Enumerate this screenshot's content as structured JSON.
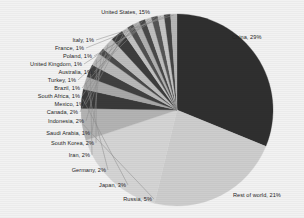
{
  "chart_data": {
    "type": "pie",
    "title": "",
    "subtitle": "",
    "xlabel": "",
    "ylabel": "",
    "legend_position": "none",
    "grid": false,
    "label_format": "{name}, {value}%",
    "categories": [
      "China",
      "Rest of world",
      "United States",
      "Russia",
      "Japan",
      "Germany",
      "Iran",
      "South Korea",
      "Saudi Arabia",
      "Indonesia",
      "Canada",
      "Mexico",
      "South Africa",
      "Brazil",
      "Turkey",
      "Australia",
      "United Kingdom",
      "Poland",
      "France",
      "Italy"
    ],
    "values": [
      29,
      21,
      15,
      5,
      3,
      2,
      2,
      2,
      1,
      2,
      2,
      1,
      1,
      1,
      1,
      1,
      1,
      1,
      1,
      1
    ],
    "slices": [
      {
        "name": "China",
        "value": 29,
        "label": "China, 29%",
        "color": "#2f2f2f"
      },
      {
        "name": "Rest of world",
        "value": 21,
        "label": "Rest of world, 21%",
        "color": "#cdcdcd"
      },
      {
        "name": "United States",
        "value": 15,
        "label": "United States, 15%",
        "color": "#d4d4d4"
      },
      {
        "name": "Russia",
        "value": 5,
        "label": "Russia, 5%",
        "color": "#b3b3b3"
      },
      {
        "name": "Japan",
        "value": 3,
        "label": "Japan, 3%",
        "color": "#3a3a3a"
      },
      {
        "name": "Germany",
        "value": 2,
        "label": "Germany, 2%",
        "color": "#a8a8a8"
      },
      {
        "name": "Iran",
        "value": 2,
        "label": "Iran, 2%",
        "color": "#404040"
      },
      {
        "name": "South Korea",
        "value": 2,
        "label": "South Korea, 2%",
        "color": "#b8b8b8"
      },
      {
        "name": "Saudi Arabia",
        "value": 1,
        "label": "Saudi Arabia, 1%",
        "color": "#4a4a4a"
      },
      {
        "name": "Indonesia",
        "value": 2,
        "label": "Indonesia, 2%",
        "color": "#bdbdbd"
      },
      {
        "name": "Canada",
        "value": 2,
        "label": "Canada, 2%",
        "color": "#3d3d3d"
      },
      {
        "name": "Mexico",
        "value": 1,
        "label": "Mexico, 1%",
        "color": "#c2c2c2"
      },
      {
        "name": "South Africa",
        "value": 1,
        "label": "South Africa, 1%",
        "color": "#505050"
      },
      {
        "name": "Brazil",
        "value": 1,
        "label": "Brazil, 1%",
        "color": "#b0b0b0"
      },
      {
        "name": "Turkey",
        "value": 1,
        "label": "Turkey, 1%",
        "color": "#484848"
      },
      {
        "name": "Australia",
        "value": 1,
        "label": "Australia, 1%",
        "color": "#bfbfbf"
      },
      {
        "name": "United Kingdom",
        "value": 1,
        "label": "United Kingdom, 1%",
        "color": "#555555"
      },
      {
        "name": "Poland",
        "value": 1,
        "label": "Poland, 1%",
        "color": "#c6c6c6"
      },
      {
        "name": "France",
        "value": 1,
        "label": "France, 1%",
        "color": "#444444"
      },
      {
        "name": "Italy",
        "value": 1,
        "label": "Italy, 1%",
        "color": "#b6b6b6"
      }
    ]
  },
  "style": {
    "background": "#f2f2f2",
    "label_color": "#262626",
    "leader_color": "#8c8c8c"
  }
}
